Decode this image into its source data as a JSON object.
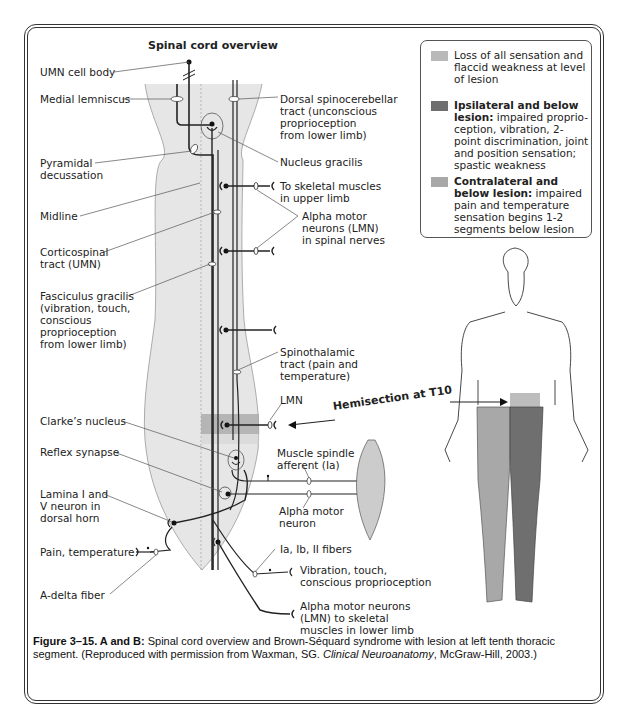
{
  "title": "Spinal cord overview",
  "labels_left": {
    "umn_cell_body": "UMN cell body",
    "medial_lemniscus": "Medial lemniscus",
    "pyramidal_decussation": "Pyramidal\ndecussation",
    "midline": "Midline",
    "corticospinal_tract": "Corticospinal\ntract (UMN)",
    "fasciculus_gracilis": "Fasciculus gracilis\n(vibration, touch,\nconscious\nproprioception\nfrom lower limb)",
    "clarkes_nucleus": "Clarke’s nucleus",
    "reflex_synapse": "Reflex synapse",
    "lamina_neuron": "Lamina I and\nV neuron in\ndorsal horn",
    "pain_temperature": "Pain, temperature",
    "a_delta_fiber": "A-delta fiber"
  },
  "labels_right": {
    "dorsal_spinocerebellar": "Dorsal spinocerebellar\ntract (unconscious\nproprioception\nfrom lower limb)",
    "nucleus_gracilis": "Nucleus gracilis",
    "skeletal_upper_limb": "To skeletal muscles\nin upper limb",
    "alpha_motor_spinal": "Alpha motor\nneurons (LMN)\nin spinal nerves",
    "spinothalamic": "Spinothalamic\ntract (pain and\ntemperature)",
    "lmn": "LMN",
    "hemisection": "Hemisection at T10",
    "muscle_spindle": "Muscle spindle\nafferent (Ia)",
    "alpha_motor_neuron": "Alpha motor\nneuron",
    "fibers": "Ia, Ib, II fibers",
    "vibration_touch": "Vibration, touch,\nconscious proprioception",
    "alpha_motor_lower": "Alpha motor neurons\n(LMN) to skeletal\nmuscles in lower limb"
  },
  "legend": {
    "items": [
      {
        "color": "#b9b9b9",
        "bold": "",
        "text": "Loss of all sensation and flaccid weakness at level of lesion"
      },
      {
        "color": "#6f6f6f",
        "bold": "Ipsilateral and below lesion:",
        "text": " impaired proprio-ception, vibration, 2-point discrimination, joint and position sensation; spastic weakness"
      },
      {
        "color": "#a8a8a8",
        "bold": "Contralateral and below lesion:",
        "text": " impaired pain and temperature sensation begins 1-2 segments below lesion"
      }
    ]
  },
  "caption": {
    "label": "Figure 3–15. A and B:",
    "text_before": "  Spinal cord overview and Brown-Séquard syndrome with lesion at left tenth thoracic segment. (Reproduced with permission from Waxman, SG. ",
    "italic": "Clinical Neuroanatomy",
    "text_after": ", McGraw-Hill, 2003.)"
  },
  "colors": {
    "cord_fill": "#e6e6e6",
    "lesion_band": "#a9a9a9",
    "ipsilateral": "#6f6f6f",
    "contralateral": "#a8a8a8",
    "line": "#222222"
  }
}
